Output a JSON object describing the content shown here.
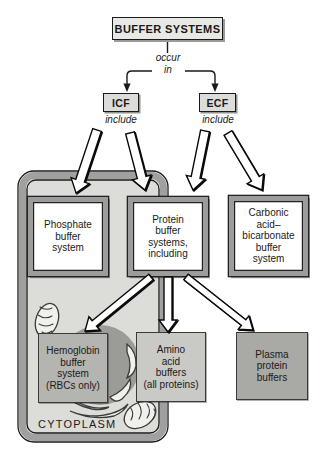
{
  "figure": {
    "title": "BUFFER SYSTEMS",
    "connector_label_line1": "occur",
    "connector_label_line2": "in",
    "icf": {
      "label": "ICF",
      "sublabel": "include"
    },
    "ecf": {
      "label": "ECF",
      "sublabel": "include"
    },
    "boxes": {
      "phosphate": "Phosphate\nbuffer\nsystem",
      "protein": "Protein\nbuffer\nsystems,\nincluding",
      "carbonic": "Carbonic\nacid–\nbicarbonate\nbuffer\nsystem",
      "hemoglobin": "Hemoglobin\nbuffer\nsystem\n(RBCs only)",
      "amino": "Amino\nacid\nbuffers\n(all proteins)",
      "plasma": "Plasma\nprotein\nbuffers"
    },
    "cell_label": "CYTOPLASM"
  },
  "colors": {
    "title_box_fill": "#e8e8e5",
    "small_box_fill": "#dcdcda",
    "cell_interior": "#dcdcd9",
    "cell_border": "#a0a09e",
    "frame_border": "#9c9c9a",
    "hemoglobin_fill": "#b4b4b0",
    "amino_fill": "#c9c9c5",
    "plasma_fill": "#a9a9a6",
    "nucleus_fill": "#9b9b97",
    "organelle_fill": "#f0f0ec",
    "line": "#1a1a1a"
  }
}
